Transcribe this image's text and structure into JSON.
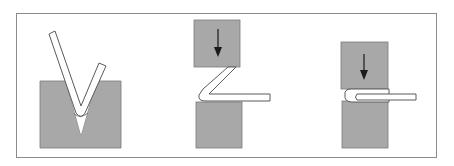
{
  "diagram": {
    "colors": {
      "background": "#ffffff",
      "frame": "#8c8c8c",
      "tool": "#a8a8a8",
      "tool_edge": "#7a7a7a",
      "strip_fill": "#ffffff",
      "strip_edge": "#5a5a5a",
      "arrow": "#1a1a1a"
    },
    "stages": [
      {
        "id": "v-bending",
        "label": "V-die bending",
        "has_arrow": false
      },
      {
        "id": "closing",
        "label": "Pressing angle closed",
        "has_arrow": true,
        "arrow_direction": "down"
      },
      {
        "id": "hemming",
        "label": "Flattening (hem)",
        "has_arrow": true,
        "arrow_direction": "down"
      }
    ]
  }
}
